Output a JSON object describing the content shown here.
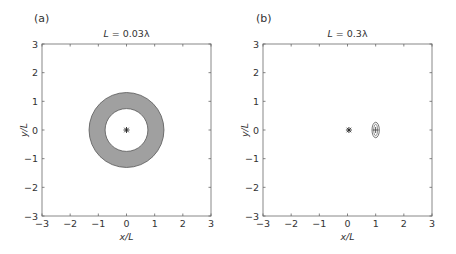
{
  "chart_data": [
    {
      "type": "scatter",
      "panel_label": "(a)",
      "title": "L = 0.03λ",
      "title_var": "L",
      "title_rest": " = 0.03λ",
      "xlabel": "x/L",
      "ylabel": "y/L",
      "xlim": [
        -3,
        3
      ],
      "ylim": [
        -3,
        3
      ],
      "xticks": [
        -3,
        -2,
        -1,
        0,
        1,
        2,
        3
      ],
      "yticks": [
        -3,
        -2,
        -1,
        0,
        1,
        2,
        3
      ],
      "xtick_labels": [
        "−3",
        "−2",
        "−1",
        "0",
        "1",
        "2",
        "3"
      ],
      "ytick_labels": [
        "−3",
        "−2",
        "−1",
        "0",
        "1",
        "2",
        "3"
      ],
      "grid": false,
      "shapes": [
        {
          "kind": "annulus",
          "cx": 0,
          "cy": 0,
          "r_outer": 1.33,
          "r_inner": 0.76,
          "fill": "#a0a0a0",
          "stroke": "#555555"
        }
      ],
      "markers": [
        {
          "kind": "star",
          "x": 0,
          "y": 0,
          "color": "#222222"
        }
      ]
    },
    {
      "type": "scatter",
      "panel_label": "(b)",
      "title": "L = 0.3λ",
      "title_var": "L",
      "title_rest": " = 0.3λ",
      "xlabel": "x/L",
      "ylabel": "y/L",
      "xlim": [
        -3,
        3
      ],
      "ylim": [
        -3,
        3
      ],
      "xticks": [
        -3,
        -2,
        -1,
        0,
        1,
        2,
        3
      ],
      "yticks": [
        -3,
        -2,
        -1,
        0,
        1,
        2,
        3
      ],
      "xtick_labels": [
        "−3",
        "−2",
        "−1",
        "0",
        "1",
        "2",
        "3"
      ],
      "ytick_labels": [
        "−3",
        "−2",
        "−1",
        "0",
        "1",
        "2",
        "3"
      ],
      "grid": false,
      "shapes": [
        {
          "kind": "ellipse",
          "cx": 1.0,
          "cy": 0.0,
          "rx": 0.13,
          "ry": 0.27,
          "fill": "none",
          "stroke": "#555555"
        },
        {
          "kind": "ellipse-inner",
          "cx": 1.0,
          "cy": 0.0,
          "rx": 0.07,
          "ry": 0.2,
          "fill": "none",
          "stroke": "#777777"
        }
      ],
      "markers": [
        {
          "kind": "star",
          "x": 0.05,
          "y": 0,
          "color": "#222222"
        },
        {
          "kind": "plus",
          "x": 1.0,
          "y": 0,
          "color": "#444444"
        }
      ]
    }
  ],
  "layout": {
    "panels": [
      {
        "left": 42,
        "top": 44,
        "right": 211,
        "bottom": 216,
        "label_x": 34,
        "label_y": 22
      },
      {
        "left": 263,
        "top": 44,
        "right": 432,
        "bottom": 216,
        "label_x": 256,
        "label_y": 22
      }
    ],
    "axis_color": "#666666",
    "frame_color": "#888888"
  }
}
